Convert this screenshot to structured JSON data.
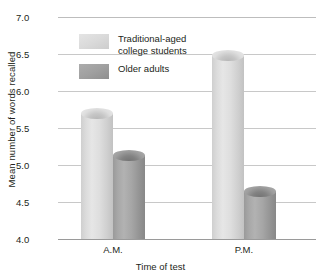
{
  "chart_data": {
    "type": "bar",
    "title": "",
    "xlabel": "Time of test",
    "ylabel": "Mean number of words recalled",
    "categories": [
      "A.M.",
      "P.M."
    ],
    "series": [
      {
        "name": "Traditional-aged\ncollege students",
        "values": [
          5.77,
          6.55
        ]
      },
      {
        "name": "Older adults",
        "values": [
          5.2,
          4.72
        ]
      }
    ],
    "ylim": [
      4.0,
      7.0
    ],
    "yticks": [
      "7.0",
      "6.5",
      "6.0",
      "5.5",
      "5.0",
      "4.5",
      "4.0"
    ],
    "ytick_values": [
      7.0,
      6.5,
      6.0,
      5.5,
      5.0,
      4.5,
      4.0
    ],
    "grid": true,
    "legend_position": "inside-top-left",
    "colors": {
      "series_1": "#dcdcdc",
      "series_2": "#a0a0a0",
      "gridline": "#c8c8c8",
      "axis": "#9a9a9a",
      "text": "#231f20"
    }
  }
}
